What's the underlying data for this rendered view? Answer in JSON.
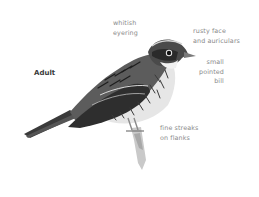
{
  "plate": {
    "age_label": "Adult",
    "annotations": [
      {
        "id": "eyering",
        "text": "whitish\neyering"
      },
      {
        "id": "face",
        "text": "rusty face\nand auriculars"
      },
      {
        "id": "bill",
        "text": "small\npointed\nbill"
      },
      {
        "id": "flanks",
        "text": "fine streaks\non flanks"
      }
    ]
  },
  "colors": {
    "background": "#ffffff",
    "label_text": "#8a8a8a",
    "age_text": "#3a3a3a"
  }
}
